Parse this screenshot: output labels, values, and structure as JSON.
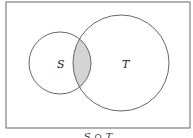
{
  "diagram": {
    "type": "venn",
    "sets": [
      {
        "name": "S",
        "label": "S"
      },
      {
        "name": "T",
        "label": "T"
      }
    ],
    "shaded_region": "S ∩ T",
    "caption": "S ∩ T",
    "colors": {
      "stroke": "#555555",
      "shade": "#d4d4d4",
      "frame": "#666666"
    }
  }
}
